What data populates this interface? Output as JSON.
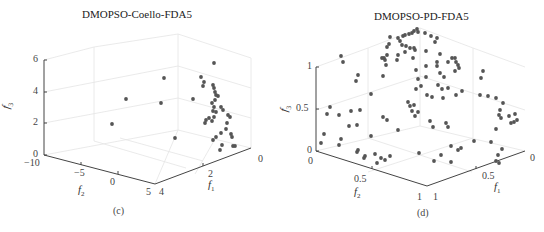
{
  "chart_data": [
    {
      "type": "scatter",
      "id": "c",
      "title": "DMOPSO-Coello-FDA5",
      "caption": "(c)",
      "xlabel": "f1",
      "ylabel": "f2",
      "zlabel": "f3",
      "projection": "3d",
      "grid": true,
      "xlim": [
        0,
        4
      ],
      "ylim": [
        -10,
        5
      ],
      "zlim": [
        0,
        6
      ],
      "x_ticks": [
        "0",
        "2",
        "4"
      ],
      "y_ticks": [
        "-10",
        "-5",
        "0",
        "5"
      ],
      "z_ticks": [
        "0",
        "2",
        "4",
        "6"
      ],
      "marker_color": "#555555",
      "points_screen_px": [
        [
          214,
          63
        ],
        [
          201,
          77
        ],
        [
          204,
          82
        ],
        [
          203,
          86
        ],
        [
          213,
          85
        ],
        [
          214,
          88
        ],
        [
          215,
          92
        ],
        [
          216,
          95
        ],
        [
          218,
          96
        ],
        [
          215,
          100
        ],
        [
          212,
          103
        ],
        [
          214,
          107
        ],
        [
          213,
          111
        ],
        [
          216,
          112
        ],
        [
          221,
          107
        ],
        [
          223,
          110
        ],
        [
          214,
          117
        ],
        [
          212,
          121
        ],
        [
          209,
          118
        ],
        [
          206,
          120
        ],
        [
          205,
          123
        ],
        [
          228,
          115
        ],
        [
          230,
          117
        ],
        [
          227,
          123
        ],
        [
          226,
          129
        ],
        [
          221,
          133
        ],
        [
          216,
          137
        ],
        [
          213,
          140
        ],
        [
          231,
          134
        ],
        [
          232,
          137
        ],
        [
          222,
          145
        ],
        [
          220,
          150
        ],
        [
          233,
          146
        ],
        [
          235,
          146
        ],
        [
          164,
          78
        ],
        [
          126,
          99
        ],
        [
          161,
          103
        ],
        [
          193,
          99
        ],
        [
          112,
          124
        ],
        [
          175,
          138
        ]
      ]
    },
    {
      "type": "scatter",
      "id": "d",
      "title": "DMOPSO-PD-FDA5",
      "caption": "(d)",
      "xlabel": "f1",
      "ylabel": "f2",
      "zlabel": "f3",
      "projection": "3d",
      "grid": true,
      "xlim": [
        0,
        1
      ],
      "ylim": [
        0,
        1
      ],
      "zlim": [
        0,
        1
      ],
      "x_ticks": [
        "0",
        "0.5",
        "1"
      ],
      "y_ticks": [
        "0",
        "0.5",
        "1"
      ],
      "z_ticks": [
        "0",
        "0.5",
        "1"
      ],
      "marker_color": "#555555",
      "points_screen_px": [
        [
          417,
          29
        ],
        [
          414,
          31
        ],
        [
          418,
          32
        ],
        [
          412,
          33
        ],
        [
          409,
          34
        ],
        [
          405,
          35
        ],
        [
          403,
          36
        ],
        [
          398,
          38
        ],
        [
          400,
          41
        ],
        [
          425,
          33
        ],
        [
          431,
          36
        ],
        [
          437,
          38
        ],
        [
          435,
          42
        ],
        [
          390,
          37
        ],
        [
          389,
          44
        ],
        [
          387,
          47
        ],
        [
          402,
          45
        ],
        [
          406,
          46
        ],
        [
          410,
          48
        ],
        [
          414,
          48
        ],
        [
          405,
          52
        ],
        [
          384,
          58
        ],
        [
          387,
          55
        ],
        [
          398,
          55
        ],
        [
          413,
          58
        ],
        [
          415,
          50
        ],
        [
          426,
          51
        ],
        [
          382,
          58
        ],
        [
          397,
          60
        ],
        [
          440,
          54
        ],
        [
          455,
          58
        ],
        [
          456,
          62
        ],
        [
          452,
          58
        ],
        [
          426,
          66
        ],
        [
          437,
          62
        ],
        [
          448,
          62
        ],
        [
          458,
          65
        ],
        [
          459,
          68
        ],
        [
          455,
          71
        ],
        [
          341,
          56
        ],
        [
          385,
          60
        ],
        [
          386,
          65
        ],
        [
          416,
          70
        ],
        [
          343,
          62
        ],
        [
          440,
          73
        ],
        [
          444,
          77
        ],
        [
          437,
          66
        ],
        [
          426,
          77
        ],
        [
          438,
          85
        ],
        [
          442,
          89
        ],
        [
          448,
          88
        ],
        [
          483,
          71
        ],
        [
          481,
          78
        ],
        [
          456,
          95
        ],
        [
          358,
          75
        ],
        [
          356,
          81
        ],
        [
          383,
          76
        ],
        [
          418,
          79
        ],
        [
          421,
          86
        ],
        [
          416,
          89
        ],
        [
          427,
          95
        ],
        [
          432,
          97
        ],
        [
          443,
          98
        ],
        [
          371,
          94
        ],
        [
          408,
          102
        ],
        [
          414,
          105
        ],
        [
          410,
          106
        ],
        [
          412,
          111
        ],
        [
          418,
          112
        ],
        [
          415,
          116
        ],
        [
          430,
          121
        ],
        [
          462,
          91
        ],
        [
          480,
          95
        ],
        [
          488,
          96
        ],
        [
          496,
          98
        ],
        [
          503,
          103
        ],
        [
          500,
          110
        ],
        [
          499,
          115
        ],
        [
          501,
          118
        ],
        [
          509,
          116
        ],
        [
          515,
          114
        ],
        [
          517,
          120
        ],
        [
          514,
          122
        ],
        [
          511,
          123
        ],
        [
          496,
          129
        ],
        [
          448,
          127
        ],
        [
          446,
          123
        ],
        [
          433,
          127
        ],
        [
          398,
          130
        ],
        [
          387,
          120
        ],
        [
          383,
          117
        ],
        [
          360,
          110
        ],
        [
          351,
          111
        ],
        [
          330,
          107
        ],
        [
          327,
          114
        ],
        [
          339,
          115
        ],
        [
          349,
          126
        ],
        [
          357,
          125
        ],
        [
          324,
          134
        ],
        [
          321,
          143
        ],
        [
          341,
          139
        ],
        [
          339,
          145
        ],
        [
          371,
          136
        ],
        [
          358,
          150
        ],
        [
          357,
          152
        ],
        [
          365,
          156
        ],
        [
          364,
          158
        ],
        [
          375,
          154
        ],
        [
          381,
          158
        ],
        [
          390,
          156
        ],
        [
          385,
          160
        ],
        [
          377,
          163
        ],
        [
          419,
          153
        ],
        [
          434,
          161
        ],
        [
          451,
          162
        ],
        [
          451,
          146
        ],
        [
          461,
          148
        ],
        [
          458,
          150
        ],
        [
          474,
          141
        ],
        [
          491,
          142
        ],
        [
          502,
          149
        ],
        [
          498,
          155
        ],
        [
          496,
          161
        ],
        [
          499,
          163
        ],
        [
          441,
          155
        ]
      ]
    }
  ],
  "panel_c": {
    "title": "DMOPSO-Coello-FDA5",
    "caption": "(c)",
    "z_ticks": [
      "0",
      "2",
      "4",
      "6"
    ],
    "y_ticks": [
      "−10",
      "−5",
      "0",
      "5"
    ],
    "x_ticks": [
      "0",
      "2",
      "4"
    ],
    "xlabel": "f",
    "xlabel_sub": "1",
    "ylabel": "f",
    "ylabel_sub": "2",
    "zlabel": "f",
    "zlabel_sub": "3"
  },
  "panel_d": {
    "title": "DMOPSO-PD-FDA5",
    "caption": "(d)",
    "z_ticks": [
      "0",
      "0.5",
      "1"
    ],
    "y_ticks": [
      "0",
      "0.5",
      "1"
    ],
    "x_ticks": [
      "0",
      "0.5",
      "1"
    ],
    "xlabel": "f",
    "xlabel_sub": "1",
    "ylabel": "f",
    "ylabel_sub": "2",
    "zlabel": "f",
    "zlabel_sub": "3"
  }
}
